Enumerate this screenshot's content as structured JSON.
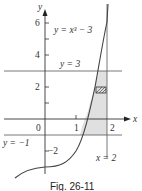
{
  "figure": {
    "caption": "Fig. 26-11",
    "axes": {
      "x_label": "x",
      "y_label": "y",
      "x_ticks": [
        "0",
        "1",
        "2"
      ],
      "y_ticks": [
        "6",
        "4",
        "2",
        "−2"
      ]
    },
    "curves": {
      "cubic_label": "y = x³ − 3",
      "upper_line_label": "y = 3",
      "lower_line_label": "y = −1",
      "vertical_line_label": "x = 2"
    },
    "colors": {
      "shade": "#e0e0e0",
      "curve": "#444444",
      "axis": "#333333"
    }
  }
}
